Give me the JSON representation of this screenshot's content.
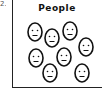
{
  "item_number": "2.",
  "panel": {
    "title": "People",
    "face_count": 8,
    "faces": [
      {
        "cx": 35,
        "cy": 32
      },
      {
        "cx": 52,
        "cy": 38
      },
      {
        "cx": 70,
        "cy": 31
      },
      {
        "cx": 86,
        "cy": 47
      },
      {
        "cx": 36,
        "cy": 58
      },
      {
        "cx": 64,
        "cy": 57
      },
      {
        "cx": 50,
        "cy": 73
      },
      {
        "cx": 82,
        "cy": 73
      }
    ]
  }
}
